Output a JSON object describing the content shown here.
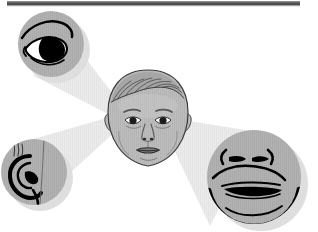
{
  "figure": {
    "domain": "Diagram",
    "title": "Infant face with magnified sensory feature insets",
    "canvas": {
      "width": 318,
      "height": 232
    },
    "background_color": "#ffffff"
  },
  "colors": {
    "page_background": "#ffffff",
    "disc_grey": "#b0b0b0",
    "disc_grey_light": "#bcbcbc",
    "disc_shadow": "#d8d8d8",
    "beam_grey": "#e9e9e9",
    "beam_grey_edge": "#dcdcdc",
    "ink_black": "#000000",
    "line_dark": "#1a1a1a",
    "face_skin": "#b0b0b0",
    "face_skin_light": "#c4c4c4",
    "hair_grey": "#a8a8a8",
    "top_bar": "#4e4e4e",
    "top_bar_shade": "#6e6e6e"
  },
  "top_bar": {
    "name": "top-edge-bar",
    "x": 7,
    "y": 2,
    "width": 293,
    "height": 4,
    "color": "#4e4e4e"
  },
  "center_face": {
    "label": "infant face",
    "role": "central subject",
    "center_x": 148,
    "center_y": 118,
    "width": 72,
    "height": 92,
    "features": [
      "hair",
      "forehead",
      "eyebrows",
      "eyes",
      "nose",
      "mouth",
      "chin",
      "ears"
    ]
  },
  "beams": [
    {
      "name": "beam-to-eye",
      "target": "eye-inset",
      "direction": "up-left",
      "apex_x": 140,
      "apex_y": 128,
      "color": "#e9e9e9"
    },
    {
      "name": "beam-to-ear",
      "target": "ear-inset",
      "direction": "down-left",
      "apex_x": 140,
      "apex_y": 112,
      "color": "#e9e9e9"
    },
    {
      "name": "beam-to-mouth",
      "target": "mouth-inset",
      "direction": "down-right",
      "apex_x": 160,
      "apex_y": 118,
      "color": "#e9e9e9"
    }
  ],
  "insets": [
    {
      "id": "eye-inset",
      "label": "eye",
      "description": "stylized open eye with upper lid, lash line and dark iris",
      "center_x": 51,
      "center_y": 44,
      "radius": 33,
      "position": "top-left",
      "fill": "#b0b0b0"
    },
    {
      "id": "ear-inset",
      "label": "ear",
      "description": "outer ear with helix, antihelix and lobe, cropped at the left edge",
      "center_x": 34,
      "center_y": 172,
      "radius": 33,
      "position": "bottom-left",
      "fill": "#b0b0b0",
      "clipped_edge": "left"
    },
    {
      "id": "mouth-inset",
      "label": "mouth",
      "description": "lower face with eyes, nose and downturned mouth",
      "center_x": 254,
      "center_y": 177,
      "radius": 47,
      "position": "bottom-right",
      "fill": "#b0b0b0",
      "clipped_edge": "bottom"
    }
  ],
  "text": {
    "visible_text": [],
    "note": "No text labels are rendered in this image."
  }
}
